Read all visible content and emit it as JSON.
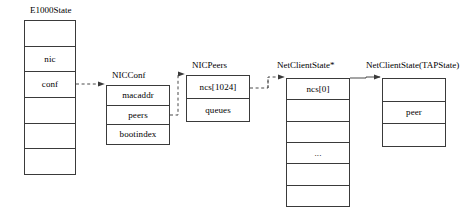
{
  "diagram": {
    "type": "struct-pointer-diagram",
    "canvas": {
      "width": 472,
      "height": 220
    },
    "structs": [
      {
        "id": "e1000state",
        "caption": "E1000State",
        "x": 24,
        "y": 20,
        "width": 52,
        "height": 155,
        "rows": [
          "",
          "nic",
          "conf",
          "",
          "",
          ""
        ]
      },
      {
        "id": "nicconf",
        "caption": "NICConf",
        "x": 106,
        "y": 85,
        "width": 64,
        "height": 60,
        "rows": [
          "macaddr",
          "peers",
          "bootindex"
        ]
      },
      {
        "id": "nicpeers",
        "caption": "NICPeers",
        "x": 186,
        "y": 75,
        "width": 64,
        "height": 47,
        "rows": [
          "ncs[1024]",
          "queues"
        ]
      },
      {
        "id": "netclientstate-ptr",
        "caption": "NetClientState*",
        "x": 286,
        "y": 78,
        "width": 64,
        "height": 129,
        "rows": [
          "ncs[0]",
          "",
          "",
          "...",
          "",
          ""
        ]
      },
      {
        "id": "netclientstate-tap",
        "caption": "NetClientState(TAPState)",
        "x": 382,
        "y": 78,
        "width": 64,
        "height": 69,
        "rows": [
          "",
          "peer",
          ""
        ]
      }
    ],
    "connectors": [
      {
        "id": "conf-to-nicconf",
        "from": "e1000state.conf",
        "to": "nicconf",
        "style": "dashed",
        "arrow": true
      },
      {
        "id": "peers-to-nicpeers",
        "from": "nicconf.peers",
        "to": "nicpeers",
        "style": "dashed",
        "arrow": true
      },
      {
        "id": "ncs1024-to-netclientstate",
        "from": "nicpeers.ncs[1024]",
        "to": "netclientstate-ptr",
        "style": "dashed",
        "arrow": true
      },
      {
        "id": "ncs0-to-tapstate",
        "from": "netclientstate-ptr.ncs[0]",
        "to": "netclientstate-tap",
        "style": "solid",
        "arrow": true
      }
    ],
    "colors": {
      "stroke": "#3a3a3a",
      "wire": "#4a4a4a",
      "background": "#ffffff",
      "text": "#000000"
    }
  }
}
